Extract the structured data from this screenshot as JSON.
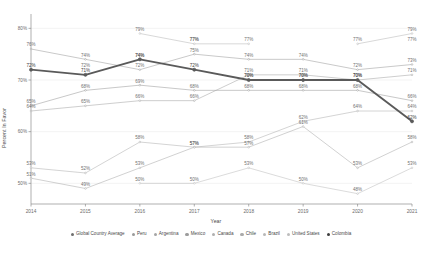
{
  "chart_data": {
    "type": "line",
    "title": "",
    "xlabel": "Year",
    "ylabel": "Percent In Favor",
    "categories": [
      "2014",
      "2015",
      "2016",
      "2017",
      "2018",
      "2019",
      "2020",
      "2021"
    ],
    "x": [
      2014,
      2015,
      2016,
      2017,
      2018,
      2019,
      2020,
      2021
    ],
    "xlim": [
      2014,
      2021
    ],
    "ylim": [
      46,
      82
    ],
    "y_ticks": [
      "80%",
      "70%",
      "60%",
      "50%"
    ],
    "y_tick_values": [
      80,
      70,
      60,
      50
    ],
    "grid": true,
    "legend_position": "bottom",
    "value_label_suffix": "%",
    "series": [
      {
        "name": "Global Country Average",
        "color": "#808080",
        "emphasis": false,
        "values": [
          null,
          null,
          null,
          null,
          null,
          null,
          null,
          null
        ],
        "labels": [
          "",
          "",
          "",
          "",
          "",
          "",
          "",
          ""
        ]
      },
      {
        "name": "Peru",
        "color": "#9a9a9a",
        "emphasis": false,
        "values": [
          65,
          68,
          69,
          68,
          68,
          68,
          68,
          66
        ],
        "labels": [
          "65%",
          "68%",
          "69%",
          "68%",
          "68%",
          "68%",
          "68%",
          "66%"
        ]
      },
      {
        "name": "Argentina",
        "color": "#a5a5a5",
        "emphasis": false,
        "values": [
          64,
          65,
          66,
          66,
          71,
          71,
          70,
          71
        ],
        "labels": [
          "64%",
          "65%",
          "66%",
          "66%",
          "71%",
          "71%",
          "70%",
          "71%"
        ]
      },
      {
        "name": "Mexico",
        "color": "#9c9c9c",
        "emphasis": false,
        "values": [
          76,
          74,
          72,
          75,
          74,
          74,
          72,
          73
        ],
        "labels": [
          "76%",
          "74%",
          "72%",
          "75%",
          "74%",
          "74%",
          "72%",
          "73%"
        ]
      },
      {
        "name": "Canada",
        "color": "#b0b0b0",
        "emphasis": false,
        "values": [
          53,
          52,
          58,
          57,
          58,
          62,
          64,
          64
        ],
        "labels": [
          "53%",
          "52%",
          "58%",
          "57%",
          "58%",
          "62%",
          "64%",
          "64%"
        ]
      },
      {
        "name": "Chile",
        "color": "#aaaaaa",
        "emphasis": false,
        "values": [
          51,
          49,
          53,
          57,
          57,
          61,
          53,
          58
        ],
        "labels": [
          "51%",
          "49%",
          "53%",
          "57%",
          "57%",
          "61%",
          "53%",
          "58%"
        ]
      },
      {
        "name": "Brazil",
        "color": "#b8b8b8",
        "emphasis": false,
        "values": [
          null,
          null,
          79,
          77,
          77,
          null,
          77,
          79
        ],
        "labels": [
          "",
          "",
          "79%",
          "77%",
          "77%",
          "",
          "77%",
          "79%"
        ]
      },
      {
        "name": "United States",
        "color": "#bdbdbd",
        "emphasis": false,
        "values": [
          null,
          null,
          50,
          50,
          53,
          50,
          48,
          53
        ],
        "labels": [
          "",
          "",
          "50%",
          "50%",
          "53%",
          "50%",
          "48%",
          "53%"
        ]
      },
      {
        "name": "Colombia",
        "color": "#5a5a5a",
        "emphasis": true,
        "values": [
          72,
          71,
          74,
          72,
          70,
          70,
          70,
          62
        ],
        "labels": [
          "72%",
          "71%",
          "74%",
          "72%",
          "70%",
          "70%",
          "70%",
          "62%"
        ]
      }
    ],
    "extra_labels": [
      {
        "x": 2015,
        "value": 72,
        "text": "72%"
      },
      {
        "x": 2016,
        "value": 74,
        "text": "74%"
      },
      {
        "x": 2017,
        "value": 77,
        "text": "77%"
      },
      {
        "x": 2018,
        "value": 70,
        "text": "70%"
      },
      {
        "x": 2019,
        "value": 70,
        "text": "70%"
      },
      {
        "x": 2021,
        "value": 77,
        "text": "77%"
      }
    ]
  },
  "legend": {
    "items": [
      {
        "label": "Global Country Average",
        "color": "#6e6e6e"
      },
      {
        "label": "Peru",
        "color": "#9a9a9a"
      },
      {
        "label": "Argentina",
        "color": "#a5a5a5"
      },
      {
        "label": "Mexico",
        "color": "#9c9c9c"
      },
      {
        "label": "Canada",
        "color": "#b0b0b0"
      },
      {
        "label": "Chile",
        "color": "#aaaaaa"
      },
      {
        "label": "Brazil",
        "color": "#b8b8b8"
      },
      {
        "label": "United States",
        "color": "#bdbdbd"
      },
      {
        "label": "Colombia",
        "color": "#3d3d3d"
      }
    ]
  }
}
